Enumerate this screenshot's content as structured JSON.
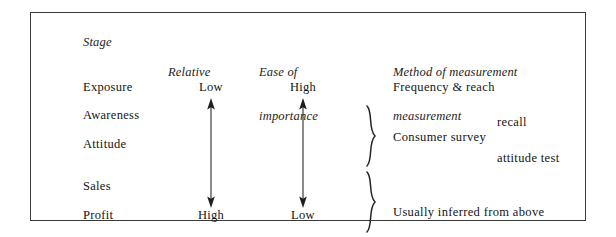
{
  "figure": {
    "headers": {
      "stage": "Stage",
      "relative_line1": "Relative",
      "ease_line1": "Ease of",
      "ease_line2": "importance",
      "method_line1": "Method of measurement",
      "method_line2": "measurement"
    },
    "stages": [
      {
        "name": "Exposure"
      },
      {
        "name": "Awareness"
      },
      {
        "name": "Attitude"
      },
      {
        "name": "Sales"
      },
      {
        "name": "Profit"
      }
    ],
    "relative_importance": {
      "top_label": "Low",
      "bottom_label": "High",
      "arrow": "double-headed-vertical-arrow"
    },
    "ease_of_measurement": {
      "top_label": "High",
      "bottom_label": "Low",
      "arrow": "double-headed-vertical-arrow"
    },
    "methods": {
      "frequency": "Frequency & reach",
      "recall": "recall",
      "consumer_survey": "Consumer survey",
      "attitude_test": "attitude test",
      "usually_inferred": "Usually inferred from above"
    },
    "braces": {
      "survey_group": "}",
      "inferred_group": "}"
    },
    "colors": {
      "border": "#3a3a3a",
      "text": "#141414",
      "background": "#ffffff"
    }
  }
}
